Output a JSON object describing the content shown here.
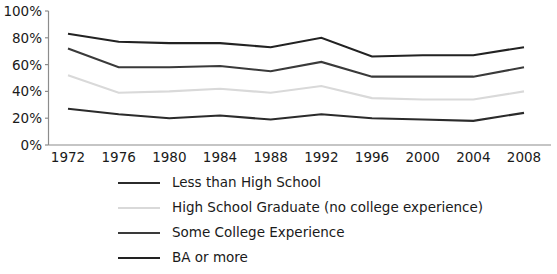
{
  "chart_data": {
    "type": "line",
    "title": "",
    "subtitle": "",
    "xlabel": "",
    "ylabel": "",
    "grid": false,
    "legend_position": "bottom-left",
    "x": [
      1972,
      1976,
      1980,
      1984,
      1988,
      1992,
      1996,
      2000,
      2004,
      2008
    ],
    "categories": [
      "1972",
      "1976",
      "1980",
      "1984",
      "1988",
      "1992",
      "1996",
      "2000",
      "2004",
      "2008"
    ],
    "xlim": [
      1972,
      2008
    ],
    "ylim": [
      0,
      100
    ],
    "ytick_values": [
      0,
      20,
      40,
      60,
      80,
      100
    ],
    "ytick_labels": [
      "0%",
      "20%",
      "40%",
      "60%",
      "80%",
      "100%"
    ],
    "series": [
      {
        "name": "Less than High School",
        "color": "#2b2b2b",
        "values": [
          27,
          23,
          20,
          22,
          19,
          23,
          20,
          19,
          18,
          24
        ]
      },
      {
        "name": "High School Graduate (no college experience)",
        "color": "#d9d9d9",
        "values": [
          52,
          39,
          40,
          42,
          39,
          44,
          35,
          34,
          34,
          40
        ]
      },
      {
        "name": "Some College Experience",
        "color": "#3a3a3a",
        "values": [
          72,
          58,
          58,
          59,
          55,
          62,
          51,
          51,
          51,
          58
        ]
      },
      {
        "name": "BA or more",
        "color": "#222222",
        "values": [
          83,
          77,
          76,
          76,
          73,
          80,
          66,
          67,
          67,
          73
        ]
      }
    ]
  },
  "legend": {
    "items": [
      {
        "label": "Less than High School",
        "color": "#2b2b2b"
      },
      {
        "label": "High School Graduate (no college experience)",
        "color": "#d9d9d9"
      },
      {
        "label": "Some College Experience",
        "color": "#3a3a3a"
      },
      {
        "label": "BA or more",
        "color": "#222222"
      }
    ]
  }
}
